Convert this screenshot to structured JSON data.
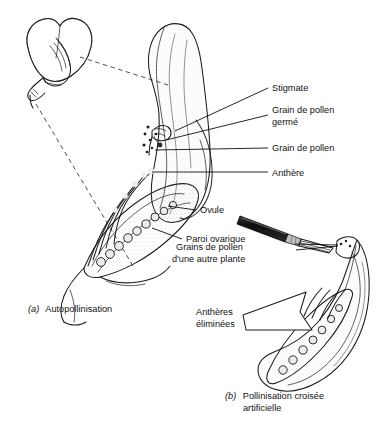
{
  "figure": {
    "title_semantic": "pollination-diagram",
    "language": "fr",
    "background_color": "#ffffff",
    "ink_color": "#1b1b1b"
  },
  "labels": {
    "stigmate": "Stigmate",
    "grain_pollen_germe_line1": "Grain de pollen",
    "grain_pollen_germe_line2": "germé",
    "grain_de_pollen": "Grain de pollen",
    "anthere": "Anthère",
    "ovule": "Ovule",
    "paroi_ovarique": "Paroi ovarique",
    "grains_autre_plante_line1": "Grains de pollen",
    "grains_autre_plante_line2": "d'une autre plante",
    "antheres_eliminees_line1": "Anthères",
    "antheres_eliminees_line2": "éliminées"
  },
  "captions": {
    "a_marker": "(a)",
    "a_text": "Autopollinisation",
    "b_marker": "(b)",
    "b_text_line1": "Pollinisation croisée",
    "b_text_line2": "artificielle"
  },
  "colors": {
    "petal_fill_light": "#f2f2f2",
    "petal_fill_mid": "#dcdcdc",
    "petal_fill_dark": "#c2c2c2",
    "ovary_fill": "#d6d6d6",
    "ovule_fill": "#e8e8e8",
    "tool_handle": "#141414",
    "tool_ferrule": "#bdbdbd"
  },
  "parts": {
    "whole_flower_icon": "pea-flower-bud",
    "magnified_section_icon": "keel-petal-cutaway",
    "tool_icon": "pollination-brush",
    "ovule_count_left": 9,
    "ovule_count_right": 7,
    "anther_count_left": 5,
    "pollen_dot_count": 7
  }
}
